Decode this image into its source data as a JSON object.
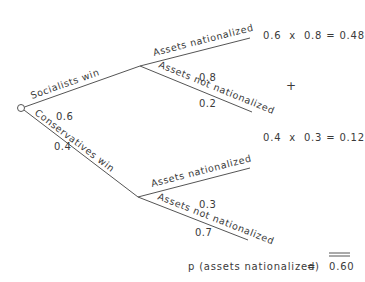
{
  "diagram": {
    "type": "probability-tree",
    "root": {
      "branches": [
        {
          "label": "Socialists win",
          "probability": "0.6",
          "children": [
            {
              "label": "Assets nationalized",
              "probability": "0.8"
            },
            {
              "label": "Assets not nationalized",
              "probability": "0.2"
            }
          ]
        },
        {
          "label": "Conservatives win",
          "probability": "0.4",
          "children": [
            {
              "label": "Assets nationalized",
              "probability": "0.3"
            },
            {
              "label": "Assets not nationalized",
              "probability": "0.7"
            }
          ]
        }
      ]
    },
    "products": [
      {
        "expression": "0.6  x  0.8 = 0.48"
      },
      {
        "expression": "0.4  x  0.3 = 0.12"
      }
    ],
    "plus_sign": "+",
    "total": {
      "label": "p (assets nationalized)",
      "equals": "=",
      "value": "0.60"
    }
  }
}
